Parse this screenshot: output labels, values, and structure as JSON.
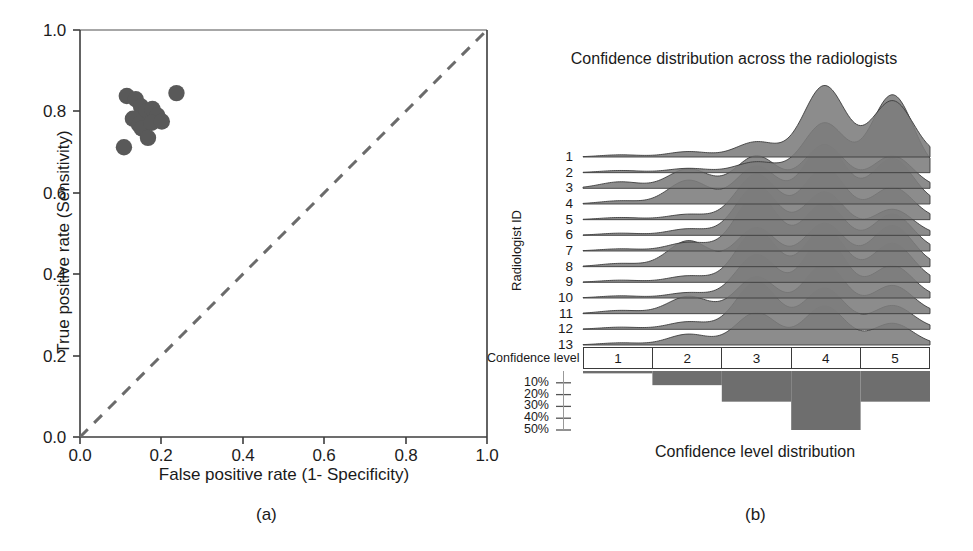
{
  "figure": {
    "sublabel_a": "(a)",
    "sublabel_b": "(b)"
  },
  "panel_a": {
    "xlabel": "False positive rate (1- Specificity)",
    "ylabel": "True positive rate (Sensitivity)",
    "xticks": [
      "0.0",
      "0.2",
      "0.4",
      "0.6",
      "0.8",
      "1.0"
    ],
    "yticks": [
      "0.0",
      "0.2",
      "0.4",
      "0.6",
      "0.8",
      "1.0"
    ],
    "marker_color": "#595959",
    "diagonal_color": "#6b6b6b"
  },
  "panel_b": {
    "title": "Confidence distribution across the radiologists",
    "ylabel": "Radiologist ID",
    "radiologist_ids": [
      "1",
      "2",
      "3",
      "4",
      "5",
      "6",
      "7",
      "8",
      "9",
      "10",
      "11",
      "12",
      "13"
    ],
    "confidence_level_caption": "Confidence level",
    "confidence_levels": [
      "1",
      "2",
      "3",
      "4",
      "5"
    ],
    "percent_ticks": [
      "10%",
      "20%",
      "30%",
      "40%",
      "50%"
    ],
    "bar_caption": "Confidence level distribution",
    "fill_color": "#7c7c7c",
    "bar_color": "#6e6e6e"
  },
  "chart_data": [
    {
      "type": "scatter",
      "title": "",
      "xlabel": "False positive rate (1- Specificity)",
      "ylabel": "True positive rate (Sensitivity)",
      "xlim": [
        0.0,
        1.0
      ],
      "ylim": [
        0.0,
        1.0
      ],
      "xticks": [
        0.0,
        0.2,
        0.4,
        0.6,
        0.8,
        1.0
      ],
      "yticks": [
        0.0,
        0.2,
        0.4,
        0.6,
        0.8,
        1.0
      ],
      "grid": false,
      "legend": "none",
      "reference_line": {
        "label": "chance diagonal",
        "x": [
          0.0,
          1.0
        ],
        "y": [
          0.0,
          1.0
        ],
        "style": "dashed"
      },
      "points": [
        {
          "x": 0.115,
          "y": 0.838
        },
        {
          "x": 0.137,
          "y": 0.83
        },
        {
          "x": 0.15,
          "y": 0.812
        },
        {
          "x": 0.163,
          "y": 0.8
        },
        {
          "x": 0.178,
          "y": 0.806
        },
        {
          "x": 0.19,
          "y": 0.79
        },
        {
          "x": 0.13,
          "y": 0.782
        },
        {
          "x": 0.145,
          "y": 0.768
        },
        {
          "x": 0.152,
          "y": 0.758
        },
        {
          "x": 0.176,
          "y": 0.772
        },
        {
          "x": 0.201,
          "y": 0.775
        },
        {
          "x": 0.167,
          "y": 0.735
        },
        {
          "x": 0.108,
          "y": 0.712
        },
        {
          "x": 0.237,
          "y": 0.845
        }
      ]
    },
    {
      "type": "area",
      "title": "Confidence distribution across the radiologists",
      "xlabel": "Confidence level",
      "ylabel": "Radiologist ID",
      "xlim": [
        0.5,
        5.5
      ],
      "xticks": [
        1,
        2,
        3,
        4,
        5
      ],
      "grid": false,
      "legend": "none",
      "note": "ridgeline (joyplot) of per-radiologist confidence density over levels 1-5",
      "series": [
        {
          "name": "1",
          "values": [
            0.02,
            0.05,
            0.14,
            0.66,
            0.52
          ]
        },
        {
          "name": "2",
          "values": [
            0.02,
            0.04,
            0.1,
            0.46,
            0.72
          ]
        },
        {
          "name": "3",
          "values": [
            0.06,
            0.18,
            0.3,
            0.4,
            0.3
          ]
        },
        {
          "name": "4",
          "values": [
            0.03,
            0.22,
            0.35,
            0.55,
            0.42
          ]
        },
        {
          "name": "5",
          "values": [
            0.02,
            0.05,
            0.42,
            0.48,
            0.3
          ]
        },
        {
          "name": "6",
          "values": [
            0.02,
            0.06,
            0.46,
            0.4,
            0.24
          ]
        },
        {
          "name": "7",
          "values": [
            0.02,
            0.08,
            0.52,
            0.44,
            0.34
          ]
        },
        {
          "name": "8",
          "values": [
            0.03,
            0.24,
            0.36,
            0.4,
            0.38
          ]
        },
        {
          "name": "9",
          "values": [
            0.02,
            0.06,
            0.48,
            0.5,
            0.36
          ]
        },
        {
          "name": "10",
          "values": [
            0.02,
            0.05,
            0.4,
            0.56,
            0.3
          ]
        },
        {
          "name": "11",
          "values": [
            0.03,
            0.16,
            0.34,
            0.46,
            0.26
          ]
        },
        {
          "name": "12",
          "values": [
            0.02,
            0.07,
            0.44,
            0.38,
            0.22
          ]
        },
        {
          "name": "13",
          "values": [
            0.02,
            0.1,
            0.3,
            0.36,
            0.2
          ]
        }
      ]
    },
    {
      "type": "bar",
      "title": "Confidence level distribution",
      "xlabel": "Confidence level",
      "ylabel": "",
      "categories": [
        "1",
        "2",
        "3",
        "4",
        "5"
      ],
      "values": [
        2,
        12,
        26,
        50,
        26
      ],
      "ylim": [
        0,
        55
      ],
      "yticks": [
        10,
        20,
        30,
        40,
        50
      ],
      "ytick_labels": [
        "10%",
        "20%",
        "30%",
        "40%",
        "50%"
      ],
      "grid": false,
      "legend": "none",
      "orientation": "inverted-downward"
    }
  ]
}
